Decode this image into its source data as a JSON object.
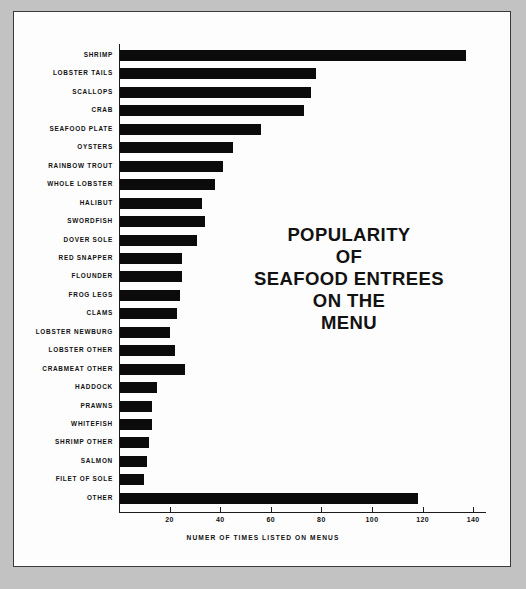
{
  "chart_data": {
    "type": "bar",
    "orientation": "horizontal",
    "title": "POPULARITY OF SEAFOOD ENTREES ON THE MENU",
    "title_lines": [
      "POPULARITY",
      "OF",
      "SEAFOOD ENTREES",
      "ON THE",
      "MENU"
    ],
    "xlabel": "NUMER OF TIMES LISTED ON MENUS",
    "ylabel": "",
    "xlim": [
      0,
      145
    ],
    "grid": false,
    "legend": null,
    "xticks": [
      20,
      40,
      60,
      80,
      100,
      120,
      140
    ],
    "xtick_labels": [
      "20",
      "40",
      "60",
      "80",
      "100",
      "120",
      "140"
    ],
    "bar_color": "#0b0b0b",
    "categories": [
      "SHRIMP",
      "LOBSTER TAILS",
      "SCALLOPS",
      "CRAB",
      "SEAFOOD PLATE",
      "OYSTERS",
      "RAINBOW TROUT",
      "WHOLE LOBSTER",
      "HALIBUT",
      "SWORDFISH",
      "DOVER SOLE",
      "RED SNAPPER",
      "FLOUNDER",
      "FROG LEGS",
      "CLAMS",
      "LOBSTER NEWBURG",
      "LOBSTER OTHER",
      "CRABMEAT OTHER",
      "HADDOCK",
      "PRAWNS",
      "WHITEFISH",
      "SHRIMP OTHER",
      "SALMON",
      "FILET OF SOLE",
      "OTHER"
    ],
    "values": [
      137,
      78,
      76,
      73,
      56,
      45,
      41,
      38,
      33,
      34,
      31,
      25,
      25,
      24,
      23,
      20,
      22,
      26,
      15,
      13,
      13,
      12,
      11,
      10,
      118
    ]
  }
}
